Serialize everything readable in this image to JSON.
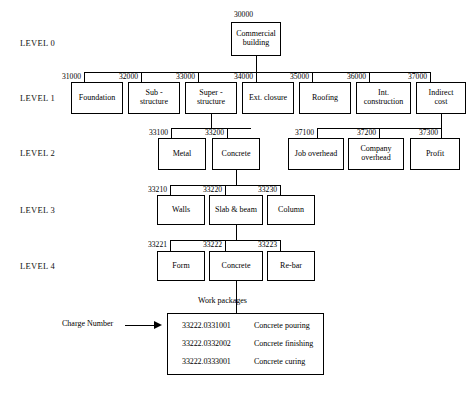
{
  "diagram": {
    "level_labels": [
      "LEVEL 0",
      "LEVEL 1",
      "LEVEL 2",
      "LEVEL 3",
      "LEVEL 4"
    ],
    "level0": {
      "nodes": [
        {
          "code": "30000",
          "label": "Commercial\nbuilding"
        }
      ]
    },
    "level1": {
      "nodes": [
        {
          "code": "31000",
          "label": "Foundation"
        },
        {
          "code": "32000",
          "label": "Sub -\nstructure"
        },
        {
          "code": "33000",
          "label": "Super -\nstructure"
        },
        {
          "code": "34000",
          "label": "Ext. closure"
        },
        {
          "code": "35000",
          "label": "Roofing"
        },
        {
          "code": "36000",
          "label": "Int.\nconstruction"
        },
        {
          "code": "37000",
          "label": "Indirect\ncost"
        }
      ]
    },
    "level2": {
      "nodes": [
        {
          "code": "33100",
          "label": "Metal"
        },
        {
          "code": "33200",
          "label": "Concrete"
        },
        {
          "code": "37100",
          "label": "Job overhead"
        },
        {
          "code": "37200",
          "label": "Company\noverhead"
        },
        {
          "code": "37300",
          "label": "Profit"
        }
      ]
    },
    "level3": {
      "nodes": [
        {
          "code": "33210",
          "label": "Walls"
        },
        {
          "code": "33220",
          "label": "Slab & beam"
        },
        {
          "code": "33230",
          "label": "Column"
        }
      ]
    },
    "level4": {
      "nodes": [
        {
          "code": "33221",
          "label": "Form"
        },
        {
          "code": "33222",
          "label": "Concrete"
        },
        {
          "code": "33223",
          "label": "Re-bar"
        }
      ]
    },
    "work_packages": {
      "caption": "Work packages",
      "rows": [
        {
          "code": "33222.0331001",
          "description": "Concrete pouring"
        },
        {
          "code": "33222.0332002",
          "description": "Concrete finishing"
        },
        {
          "code": "33222.0333001",
          "description": "Concrete curing"
        }
      ]
    },
    "annotation": {
      "charge_number_label": "Charge Number"
    },
    "colors": {
      "background": "#ffffff",
      "line": "#000000",
      "text": "#000000"
    }
  }
}
